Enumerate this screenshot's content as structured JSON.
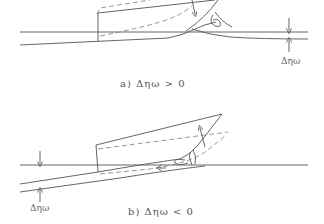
{
  "panels": [
    {
      "id": "a",
      "caption": "a)  Δηω  >  0",
      "dimension_label": "Δηω"
    },
    {
      "id": "b",
      "caption": "b)  Δηω  <  0",
      "dimension_label": "Δηω"
    }
  ],
  "colors": {
    "line": "#555555",
    "dashed": "#8a8a8a",
    "background": "#ffffff"
  }
}
